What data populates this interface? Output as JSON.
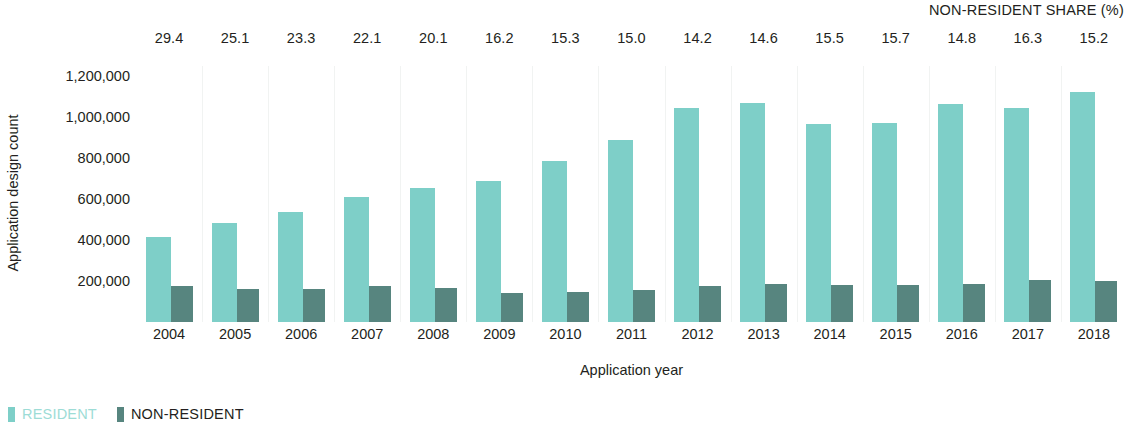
{
  "chart_data": {
    "type": "bar",
    "title": "",
    "xlabel": "Application year",
    "ylabel": "Application design count",
    "categories": [
      "2004",
      "2005",
      "2006",
      "2007",
      "2008",
      "2009",
      "2010",
      "2011",
      "2012",
      "2013",
      "2014",
      "2015",
      "2016",
      "2017",
      "2018"
    ],
    "series": [
      {
        "name": "RESIDENT",
        "color": "#7ecfc8",
        "values": [
          415000,
          485000,
          535000,
          610000,
          655000,
          690000,
          785000,
          890000,
          1043000,
          1068000,
          965000,
          970000,
          1063000,
          1045000,
          1125000
        ]
      },
      {
        "name": "NON-RESIDENT",
        "color": "#57857f",
        "values": [
          175000,
          163000,
          163000,
          175000,
          167000,
          140000,
          145000,
          158000,
          175000,
          185000,
          180000,
          182000,
          187000,
          205000,
          202000
        ]
      }
    ],
    "annotation_row": {
      "label": "NON-RESIDENT SHARE (%)",
      "values": [
        "29.4",
        "25.1",
        "23.3",
        "22.1",
        "20.1",
        "16.2",
        "15.3",
        "15.0",
        "14.2",
        "14.6",
        "15.5",
        "15.7",
        "14.8",
        "16.3",
        "15.2"
      ]
    },
    "yticks": [
      "200,000",
      "400,000",
      "600,000",
      "800,000",
      "1,000,000",
      "1,200,000"
    ],
    "ytick_values": [
      200000,
      400000,
      600000,
      800000,
      1000000,
      1200000
    ],
    "ylim": [
      0,
      1250000
    ],
    "grid": "vertical-faint",
    "legend_position": "bottom-left",
    "legend": [
      {
        "label": "RESIDENT",
        "color": "#7ecfc8"
      },
      {
        "label": "NON-RESIDENT",
        "color": "#57857f"
      }
    ]
  }
}
